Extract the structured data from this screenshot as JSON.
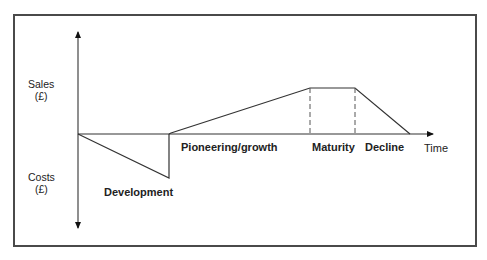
{
  "diagram": {
    "type": "product-life-cycle",
    "axes": {
      "y_top_label": "Sales",
      "y_top_unit": "(£)",
      "y_bottom_label": "Costs",
      "y_bottom_unit": "(£)",
      "x_label": "Time"
    },
    "phases": [
      {
        "label": "Development"
      },
      {
        "label": "Pioneering/growth"
      },
      {
        "label": "Maturity"
      },
      {
        "label": "Decline"
      }
    ],
    "colors": {
      "line": "#333333",
      "frame": "#4a4a4a",
      "text": "#222222"
    }
  }
}
